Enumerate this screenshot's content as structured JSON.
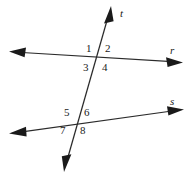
{
  "figure": {
    "background_color": "#ffffff",
    "stroke_color": "#2b2b2b",
    "label_color": "#1a1a1a",
    "width": 195,
    "height": 178
  },
  "lines": [
    {
      "id": "line-r",
      "label": "r",
      "label_x": 170,
      "label_y": 45,
      "x1": 14,
      "y1": 52,
      "x2": 178,
      "y2": 62,
      "arrow_start": true,
      "arrow_end": true
    },
    {
      "id": "line-s",
      "label": "s",
      "label_x": 170,
      "label_y": 96,
      "x1": 13,
      "y1": 133,
      "x2": 180,
      "y2": 110,
      "arrow_start": true,
      "arrow_end": true
    },
    {
      "id": "line-t",
      "label": "t",
      "label_x": 120,
      "label_y": 8,
      "x1": 64,
      "y1": 171,
      "x2": 110,
      "y2": 9,
      "arrow_start": true,
      "arrow_end": true
    }
  ],
  "intersections": [
    {
      "id": "intersection-top",
      "x": 97,
      "y": 59,
      "lines": [
        "line-r",
        "line-t"
      ]
    },
    {
      "id": "intersection-bottom",
      "x": 77,
      "y": 122,
      "lines": [
        "line-s",
        "line-t"
      ]
    }
  ],
  "angles": [
    {
      "id": "angle-1",
      "label": "1",
      "x": 86,
      "y": 43,
      "intersection": "intersection-top",
      "position": "upper-left"
    },
    {
      "id": "angle-2",
      "label": "2",
      "x": 105,
      "y": 43,
      "intersection": "intersection-top",
      "position": "upper-right"
    },
    {
      "id": "angle-3",
      "label": "3",
      "x": 83,
      "y": 62,
      "intersection": "intersection-top",
      "position": "lower-left"
    },
    {
      "id": "angle-4",
      "label": "4",
      "x": 102,
      "y": 62,
      "intersection": "intersection-top",
      "position": "lower-right"
    },
    {
      "id": "angle-5",
      "label": "5",
      "x": 64,
      "y": 107,
      "intersection": "intersection-bottom",
      "position": "upper-left"
    },
    {
      "id": "angle-6",
      "label": "6",
      "x": 84,
      "y": 107,
      "intersection": "intersection-bottom",
      "position": "upper-right"
    },
    {
      "id": "angle-7",
      "label": "7",
      "x": 60,
      "y": 125,
      "intersection": "intersection-bottom",
      "position": "lower-left"
    },
    {
      "id": "angle-8",
      "label": "8",
      "x": 80,
      "y": 125,
      "intersection": "intersection-bottom",
      "position": "lower-right"
    }
  ]
}
